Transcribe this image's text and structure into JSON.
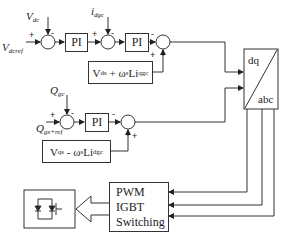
{
  "diagram": {
    "title": "",
    "type": "control-block-diagram",
    "d_axis_loop": {
      "outer_reference_input": {
        "symbol": "V",
        "sub": "dcref",
        "sign": "+"
      },
      "outer_feedback_input": {
        "symbol": "V",
        "sub": "dc",
        "sign": "-"
      },
      "outer_controller": "PI",
      "inner_feedback_input": {
        "symbol": "i",
        "sub": "dgc",
        "sign": "-"
      },
      "inner_reference_sign": "+",
      "inner_controller": "PI",
      "decoupling_sum_signs": {
        "controller": "-",
        "feedforward": "+"
      },
      "feedforward_block": {
        "main": "V",
        "sub1": "ds",
        "op": " + ω",
        "sub2": "s",
        "tail": "Li",
        "sub3": "qgc"
      }
    },
    "q_axis_loop": {
      "reference_input": {
        "symbol": "Q",
        "sub": "gs+ref",
        "sign": "+"
      },
      "feedback_input": {
        "symbol": "Q",
        "sub": "gc",
        "sign": "-"
      },
      "controller": "PI",
      "decoupling_sum_signs": {
        "controller": "-",
        "feedforward": "+"
      },
      "feedforward_block": {
        "main": "V",
        "sub1": "qs",
        "op": " - ω",
        "sub2": "s",
        "tail": "Li",
        "sub3": "dgc"
      }
    },
    "transform_block": {
      "top": "dq",
      "bottom": "abc"
    },
    "pwm_block": {
      "lines": [
        "PWM",
        "IGBT",
        "Switching"
      ]
    },
    "converter_block": {
      "icon": "igbt-diode-icon"
    },
    "connections": [
      "Vdcref -> sum1",
      "Vdc -> sum1",
      "sum1 -> PI1",
      "PI1 -> sum2",
      "idgc -> sum2",
      "sum2 -> PI2",
      "PI2 -> sum3",
      "Vds+wsLiqgc -> sum3",
      "sum3 -> dq/abc (d)",
      "Qgs+ref -> sum4",
      "Qgc -> sum4",
      "sum4 -> PI3",
      "PI3 -> sum5",
      "Vqs-wsLidgc -> sum5",
      "sum5 -> dq/abc (q)",
      "dq/abc (a,b,c) -> PWM IGBT Switching",
      "PWM IGBT Switching => converter"
    ]
  }
}
